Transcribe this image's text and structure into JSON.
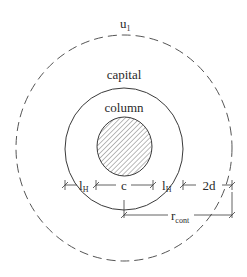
{
  "diagram": {
    "labels": {
      "outer_perimeter": "u",
      "outer_perimeter_sub": "1",
      "capital": "capital",
      "column": "column",
      "dim_l1_left": "l",
      "dim_l1_left_sub": "H",
      "dim_c": "c",
      "dim_l1_right": "l",
      "dim_l1_right_sub": "H",
      "dim_2d": "2d",
      "dim_r": "r",
      "dim_r_sub": "cont"
    },
    "colors": {
      "stroke": "#3a3a3a",
      "dashed_stroke": "#555555",
      "hatch": "#555555",
      "background": "#ffffff"
    }
  }
}
